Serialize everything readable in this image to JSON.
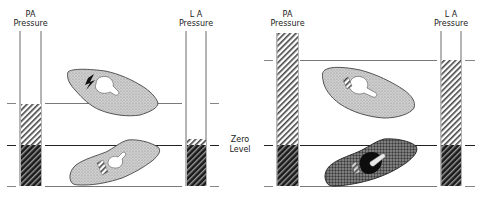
{
  "left_panel": {
    "pa_label_line1": "PA",
    "pa_label_line2": "Pressure",
    "la_label_line1": "L A",
    "la_label_line2": "Pressure"
  },
  "center": {
    "zero_line1": "Zero",
    "zero_line2": "Level"
  },
  "right_panel": {
    "pa_label_line1": "PA",
    "pa_label_line2": "Pressure",
    "la_label_line1": "L A",
    "la_label_line2": "Pressure"
  },
  "colors": {
    "line": "#333333",
    "lung_fill": "#c8c8c8",
    "lung_dark_fill": "#6a6a6a",
    "hatch_light": "#444444",
    "hatch_dark": "#111111"
  }
}
